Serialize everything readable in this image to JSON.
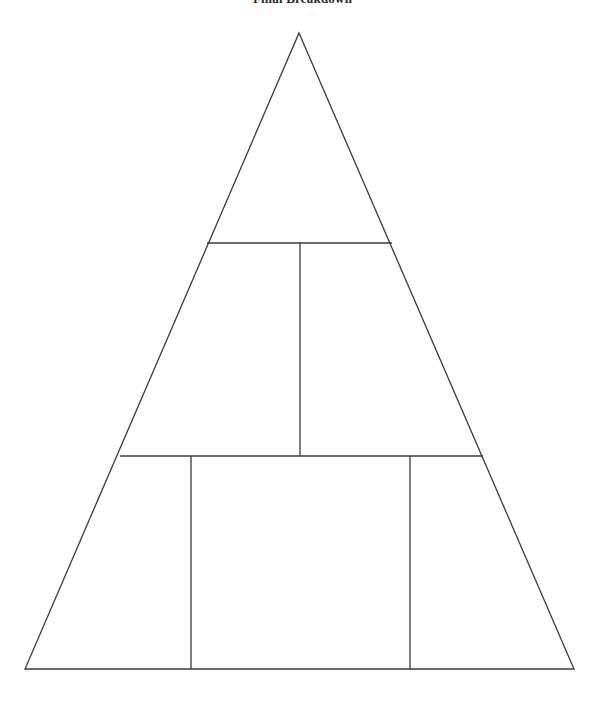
{
  "page": {
    "title": "Final Breakdown",
    "background_color": "#ffffff",
    "width": 605,
    "height": 702
  },
  "diagram": {
    "type": "pyramid",
    "name": "segmented-triangle-pyramid",
    "stroke_color": "#3a3a3a",
    "stroke_width": 1.3,
    "fill_color": "none",
    "apex": {
      "x": 299,
      "y": 33
    },
    "base_left": {
      "x": 25,
      "y": 669
    },
    "base_right": {
      "x": 574,
      "y": 669
    },
    "tiers": [
      {
        "name": "tier-top",
        "index": 1,
        "cells": 1,
        "top_y": 33,
        "bottom_y": 243,
        "label": ""
      },
      {
        "name": "tier-middle",
        "index": 2,
        "cells": 2,
        "top_y": 243,
        "bottom_y": 456,
        "label": ""
      },
      {
        "name": "tier-bottom",
        "index": 3,
        "cells": 3,
        "top_y": 456,
        "bottom_y": 669,
        "label": ""
      }
    ],
    "horizontal_dividers": [
      {
        "name": "divider-upper",
        "y": 243,
        "x1": 207,
        "x2": 392
      },
      {
        "name": "divider-lower",
        "y": 456,
        "x1": 120,
        "x2": 483
      }
    ],
    "vertical_dividers": [
      {
        "name": "divider-middle-center",
        "x": 300,
        "y1": 243,
        "y2": 456
      },
      {
        "name": "divider-bottom-left",
        "x": 191,
        "y1": 456,
        "y2": 669
      },
      {
        "name": "divider-bottom-right",
        "x": 410,
        "y1": 456,
        "y2": 669
      }
    ]
  },
  "chart_data": {
    "type": "diagram",
    "title": "Final Breakdown",
    "shape": "pyramid",
    "levels": 3,
    "segments_per_level": [
      1,
      2,
      3
    ],
    "total_segments": 6,
    "labels": [],
    "values": [],
    "grid": false,
    "legend": null
  }
}
